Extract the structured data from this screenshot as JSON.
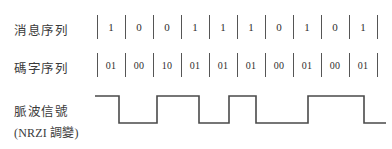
{
  "diagram": {
    "title_rows": {
      "message_label": "消息序列",
      "codeword_label": "碼字序列",
      "pulse_label": "脈波信號",
      "modulation_label": "(NRZI 調變)"
    },
    "message_sequence": [
      "1",
      "0",
      "0",
      "1",
      "1",
      "1",
      "0",
      "1",
      "0",
      "1"
    ],
    "codeword_sequence": [
      "01",
      "00",
      "10",
      "01",
      "01",
      "01",
      "00",
      "01",
      "00",
      "01"
    ],
    "waveform": {
      "name": "nrzi-pulse-waveform",
      "levels": [
        "high",
        "low",
        "high",
        "low",
        "high",
        "low",
        "high",
        "low"
      ],
      "transitions_x": [
        119,
        157,
        199,
        229,
        256,
        308,
        364
      ],
      "start_x": 95,
      "end_x": 386,
      "high_y": 96,
      "low_y": 123,
      "stroke_color": "#4a4a4a"
    },
    "grid": {
      "cell_count": 10,
      "cell_width": 28,
      "start_x": 97,
      "separator_color": "#555555"
    },
    "text_color": "#303030",
    "background_color": "#ffffff"
  }
}
